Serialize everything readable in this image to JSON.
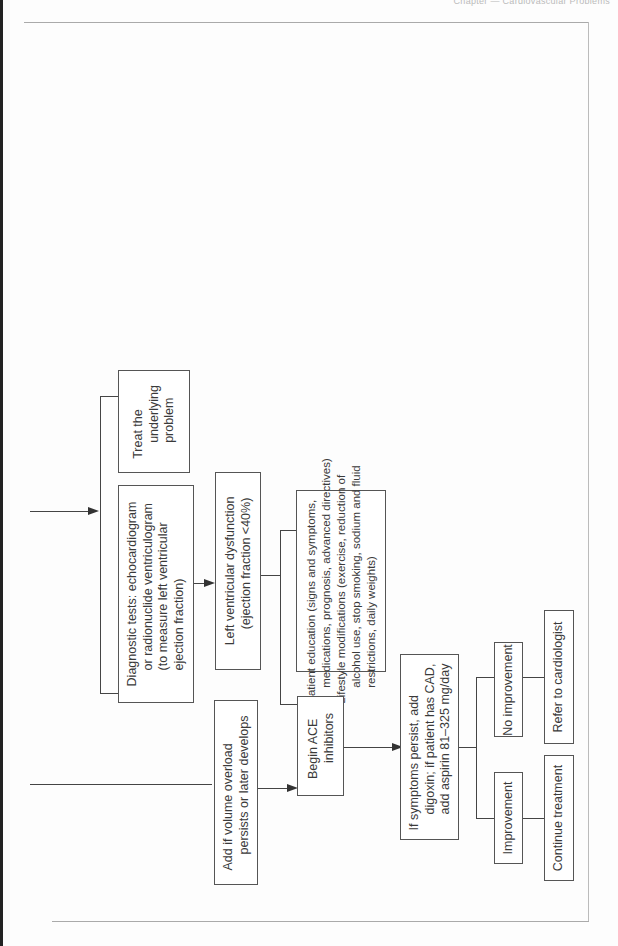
{
  "page": {
    "header_partial": "Chapter — Cardiovascular Problems"
  },
  "flowchart": {
    "orientation": "rotated-90-ccw",
    "nodes": {
      "treat_underlying": {
        "lines": [
          "Treat the",
          "underlying",
          "problem"
        ]
      },
      "diagnostic_tests": {
        "lines": [
          "Diagnostic tests: echocardiogram",
          "or radionuclide ventriculogram",
          "(to measure left ventricular",
          "ejection fraction)"
        ]
      },
      "lv_dysfunction": {
        "lines": [
          "Left ventricular dysfunction",
          "(ejection fraction <40%)"
        ]
      },
      "patient_education": {
        "lines": [
          "Patient education (signs and symptoms,",
          "medications, prognosis, advanced directives)",
          "Lifestyle modifications (exercise, reduction of",
          "alcohol use, stop smoking, sodium and fluid",
          "restrictions, daily weights)"
        ]
      },
      "add_volume": {
        "lines": [
          "Add if volume overload",
          "persists or later develops"
        ]
      },
      "begin_ace": {
        "lines": [
          "Begin ACE",
          "inhibitors"
        ]
      },
      "symptoms_persist": {
        "lines": [
          "If symptoms persist, add",
          "digoxin; if patient has CAD,",
          "add aspirin 81–325 mg/day"
        ]
      },
      "improvement": {
        "lines": [
          "Improvement"
        ]
      },
      "no_improvement": {
        "lines": [
          "No improvement"
        ]
      },
      "continue_treatment": {
        "lines": [
          "Continue treatment"
        ]
      },
      "refer_cardiologist": {
        "lines": [
          "Refer to cardiologist"
        ]
      }
    }
  }
}
